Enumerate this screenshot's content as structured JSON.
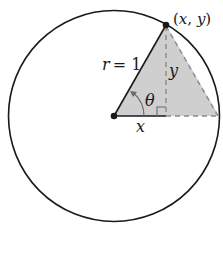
{
  "diagram": {
    "type": "unit-circle",
    "colors": {
      "stroke": "#1a1a1a",
      "fill": "#cfcfcf",
      "dash": "#8a8a8a",
      "background": "#ffffff"
    },
    "labels": {
      "point": "(x, y)",
      "radius": "r = 1",
      "radius_var": "r",
      "radius_eq": "= 1",
      "opposite": "y",
      "adjacent": "x",
      "angle": "θ"
    },
    "icons": {
      "center_point": "filled-dot",
      "point_on_circle": "filled-dot",
      "angle_arrow": "curved-arrow",
      "right_angle": "square-marker"
    }
  }
}
